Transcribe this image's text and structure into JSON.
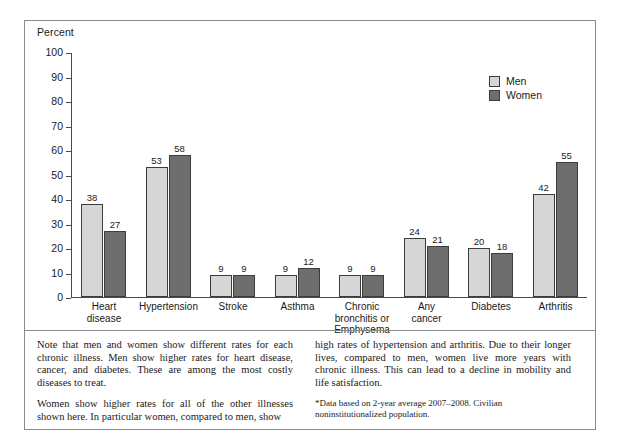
{
  "chart_data": {
    "type": "bar",
    "title": "",
    "ylabel": "Percent",
    "xlabel": "",
    "ylim": [
      0,
      100
    ],
    "yticks": [
      0,
      10,
      20,
      30,
      40,
      50,
      60,
      70,
      80,
      90,
      100
    ],
    "grid": false,
    "legend_position": "top-right",
    "categories": [
      "Heart\ndisease",
      "Hypertension",
      "Stroke",
      "Asthma",
      "Chronic\nbronchitis or\nEmphysema",
      "Any\ncancer",
      "Diabetes",
      "Arthritis"
    ],
    "series": [
      {
        "name": "Men",
        "color": "#d6d6d6",
        "values": [
          38,
          53,
          9,
          9,
          9,
          24,
          20,
          42
        ]
      },
      {
        "name": "Women",
        "color": "#6e6e6e",
        "values": [
          27,
          58,
          9,
          12,
          9,
          21,
          18,
          55
        ]
      }
    ]
  },
  "caption": {
    "left": [
      "Note that men and women show different rates for each chronic illness. Men show higher rates for heart disease, cancer, and diabetes. These are among the most costly diseases to treat.",
      "Women show higher rates for all of the other illnesses shown here. In particular women, compared to men, show"
    ],
    "right": [
      "high rates of hypertension and arthritis. Due to their longer lives, compared to men, women live more years with chronic illness. This can lead to a decline in mobility and life satisfaction."
    ],
    "footnote": "*Data based on 2-year average 2007–2008. Civilian noninstitutionalized population."
  }
}
